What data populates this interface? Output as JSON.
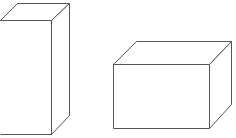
{
  "diagram": {
    "stroke_color": "#555555",
    "background": "#ffffff",
    "shapes": [
      {
        "name": "tall-box",
        "type": "cuboid",
        "front": {
          "x": 0,
          "y": 20,
          "w": 51,
          "h": 114
        },
        "depth_offset": {
          "dx": 18,
          "dy": -17
        }
      },
      {
        "name": "wide-box",
        "type": "cuboid",
        "front": {
          "x": 113,
          "y": 64,
          "w": 96,
          "h": 64
        },
        "depth_offset": {
          "dx": 22,
          "dy": -23
        }
      }
    ]
  }
}
